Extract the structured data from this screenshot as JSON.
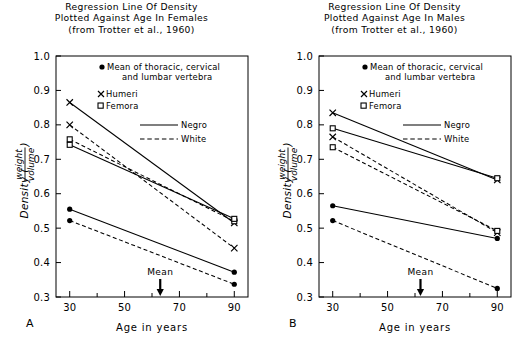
{
  "figure": {
    "panels": [
      {
        "panel_label": "A",
        "title_lines": [
          "Regression Line Of Density",
          "Plotted Against Age In Females",
          "(from Trotter et al., 1960)"
        ],
        "xlabel": "Age in years",
        "ylabel_main": "Density (",
        "ylabel_num": "weight",
        "ylabel_den": "volume",
        "ylabel_close": ")",
        "mean_label": "Mean",
        "mean_age": 63
      },
      {
        "panel_label": "B",
        "title_lines": [
          "Regression Line Of Density",
          "Plotted Against Age In Males",
          "(from Trotter et al., 1960)"
        ],
        "xlabel": "Age in years",
        "ylabel_main": "Density (",
        "ylabel_num": "weight",
        "ylabel_den": "volume",
        "ylabel_close": ")",
        "mean_label": "Mean",
        "mean_age": 62
      }
    ],
    "legend": {
      "vertebra_line1": "Mean of thoracic, cervical",
      "vertebra_line2": "and lumbar vertebra",
      "humeri": "Humeri",
      "femora": "Femora",
      "negro": "Negro",
      "white": "White",
      "marker_vertebra": "filled-circle",
      "marker_humeri": "x-cross",
      "marker_femora": "open-square",
      "line_negro": "solid",
      "line_white": "dashed"
    },
    "axes": {
      "x_ticks_major": [
        30,
        50,
        70,
        90
      ],
      "x_ticks_minor": [
        40,
        60,
        80
      ],
      "x_range": [
        25,
        95
      ],
      "y_ticks": [
        "1.0",
        "0.9",
        "0.8",
        "0.7",
        "0.6",
        "0.5",
        "0.4",
        "0.3"
      ],
      "y_range": [
        0.3,
        1.0
      ],
      "grid": "off"
    },
    "colors": {
      "line": "#000000",
      "background": "#ffffff",
      "frame": "#000000"
    }
  },
  "chart_data": [
    {
      "type": "line",
      "title": "Regression Line Of Density Plotted Against Age In Females (from Trotter et al., 1960)",
      "panel": "A",
      "xlabel": "Age in years",
      "ylabel": "Density (weight/volume)",
      "x": [
        30,
        90
      ],
      "xlim": [
        25,
        95
      ],
      "ylim": [
        0.3,
        1.0
      ],
      "legend_position": "inside-top-right",
      "grid": false,
      "annotations": [
        {
          "text": "Mean",
          "x": 63,
          "y": 0.3,
          "style": "down-arrow"
        }
      ],
      "series": [
        {
          "name": "Humeri Negro",
          "marker": "x-cross",
          "linestyle": "solid",
          "values": [
            0.865,
            0.515
          ]
        },
        {
          "name": "Humeri White",
          "marker": "x-cross",
          "linestyle": "dashed",
          "values": [
            0.8,
            0.442
          ]
        },
        {
          "name": "Femora White",
          "marker": "open-square",
          "linestyle": "dashed",
          "values": [
            0.758,
            0.52
          ]
        },
        {
          "name": "Femora Negro",
          "marker": "open-square",
          "linestyle": "solid",
          "values": [
            0.742,
            0.527
          ]
        },
        {
          "name": "Vertebra Negro",
          "marker": "filled-circle",
          "linestyle": "solid",
          "values": [
            0.555,
            0.372
          ]
        },
        {
          "name": "Vertebra White",
          "marker": "filled-circle",
          "linestyle": "dashed",
          "values": [
            0.522,
            0.337
          ]
        }
      ]
    },
    {
      "type": "line",
      "title": "Regression Line Of Density Plotted Against Age In Males (from Trotter et al., 1960)",
      "panel": "B",
      "xlabel": "Age in years",
      "ylabel": "Density (weight/volume)",
      "x": [
        30,
        90
      ],
      "xlim": [
        25,
        95
      ],
      "ylim": [
        0.3,
        1.0
      ],
      "legend_position": "inside-top-right",
      "grid": false,
      "annotations": [
        {
          "text": "Mean",
          "x": 62,
          "y": 0.3,
          "style": "down-arrow"
        }
      ],
      "series": [
        {
          "name": "Humeri Negro",
          "marker": "x-cross",
          "linestyle": "solid",
          "values": [
            0.835,
            0.64
          ]
        },
        {
          "name": "Femora Negro",
          "marker": "open-square",
          "linestyle": "solid",
          "values": [
            0.79,
            0.645
          ]
        },
        {
          "name": "Humeri White",
          "marker": "x-cross",
          "linestyle": "dashed",
          "values": [
            0.765,
            0.487
          ]
        },
        {
          "name": "Femora White",
          "marker": "open-square",
          "linestyle": "dashed",
          "values": [
            0.735,
            0.492
          ]
        },
        {
          "name": "Vertebra Negro",
          "marker": "filled-circle",
          "linestyle": "solid",
          "values": [
            0.565,
            0.47
          ]
        },
        {
          "name": "Vertebra White",
          "marker": "filled-circle",
          "linestyle": "dashed",
          "values": [
            0.522,
            0.325
          ]
        }
      ]
    }
  ]
}
